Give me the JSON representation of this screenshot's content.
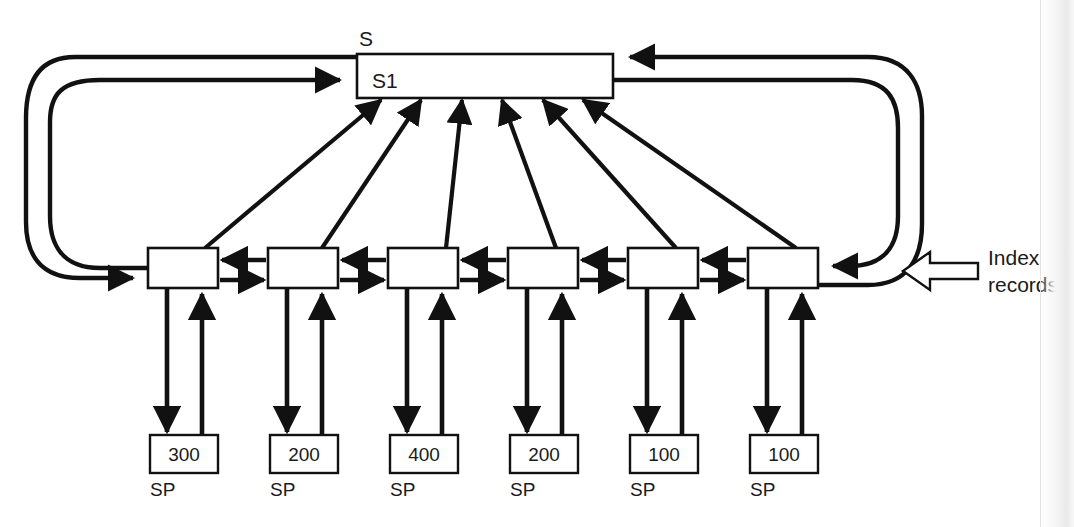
{
  "diagram": {
    "title_label": "S",
    "set_box": {
      "name_label": "S1"
    },
    "annotation": {
      "line1": "Index",
      "line2": "records",
      "arrow_icon": "hollow-left-arrow-icon"
    },
    "index_records": [
      {
        "id": "index-record-1",
        "sp_value": "300",
        "sp_label": "SP"
      },
      {
        "id": "index-record-2",
        "sp_value": "200",
        "sp_label": "SP"
      },
      {
        "id": "index-record-3",
        "sp_value": "400",
        "sp_label": "SP"
      },
      {
        "id": "index-record-4",
        "sp_value": "200",
        "sp_label": "SP"
      },
      {
        "id": "index-record-5",
        "sp_value": "100",
        "sp_label": "SP"
      },
      {
        "id": "index-record-6",
        "sp_value": "100",
        "sp_label": "SP"
      }
    ],
    "colors": {
      "stroke": "#111111",
      "background": "#ffffff",
      "text": "#1a1a1a"
    }
  }
}
